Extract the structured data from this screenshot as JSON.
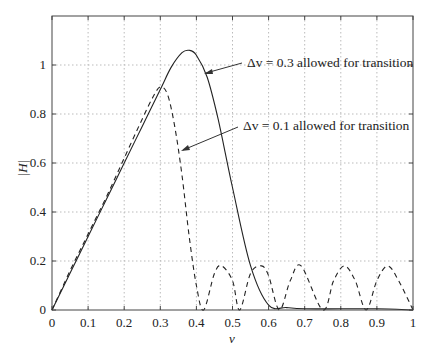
{
  "chart_data": {
    "type": "line",
    "title": "",
    "xlabel": "v",
    "ylabel": "|H|",
    "xlim": [
      0,
      1
    ],
    "ylim": [
      0,
      1.2
    ],
    "grid": true,
    "x_ticks": [
      "0",
      "0.1",
      "0.2",
      "0.3",
      "0.4",
      "0.5",
      "0.6",
      "0.7",
      "0.8",
      "0.9",
      "1"
    ],
    "y_ticks": [
      "0",
      "0.2",
      "0.4",
      "0.6",
      "0.8",
      "1"
    ],
    "series": [
      {
        "name": "Δv = 0.3 allowed for transition",
        "style": "solid",
        "x": [
          0,
          0.05,
          0.1,
          0.15,
          0.2,
          0.25,
          0.3,
          0.33,
          0.36,
          0.38,
          0.4,
          0.43,
          0.46,
          0.5,
          0.55,
          0.6,
          0.65,
          0.7,
          0.8,
          0.9,
          1.0
        ],
        "values": [
          0,
          0.15,
          0.3,
          0.45,
          0.6,
          0.75,
          0.9,
          0.99,
          1.05,
          1.06,
          1.04,
          0.95,
          0.78,
          0.5,
          0.18,
          0.02,
          0.01,
          0.005,
          0.005,
          0.005,
          0.0
        ]
      },
      {
        "name": "Δv = 0.1 allowed for transition",
        "style": "dashed",
        "x": [
          0,
          0.05,
          0.1,
          0.15,
          0.2,
          0.25,
          0.28,
          0.3,
          0.32,
          0.34,
          0.36,
          0.38,
          0.4,
          0.42,
          0.45,
          0.47,
          0.5,
          0.52,
          0.55,
          0.58,
          0.6,
          0.63,
          0.66,
          0.69,
          0.75,
          0.78,
          0.81,
          0.84,
          0.87,
          0.9,
          0.93,
          0.96,
          1.0
        ],
        "values": [
          0,
          0.16,
          0.31,
          0.46,
          0.62,
          0.78,
          0.87,
          0.91,
          0.88,
          0.75,
          0.55,
          0.3,
          0.1,
          0.0,
          0.15,
          0.18,
          0.12,
          0.0,
          0.15,
          0.18,
          0.14,
          0.0,
          0.12,
          0.18,
          0.0,
          0.12,
          0.18,
          0.12,
          0.0,
          0.12,
          0.18,
          0.12,
          0.0
        ]
      }
    ],
    "annotations": [
      {
        "text": "Δv = 0.3 allowed for transition",
        "arrow_to": [
          0.4,
          1.0
        ]
      },
      {
        "text": "Δv = 0.1 allowed for transition",
        "arrow_to": [
          0.34,
          0.75
        ]
      }
    ]
  },
  "labels": {
    "ylabel": "|H|",
    "xlabel": "v",
    "ann1": "Δv = 0.3 allowed for transition",
    "ann2": "Δv = 0.1 allowed for transition"
  }
}
